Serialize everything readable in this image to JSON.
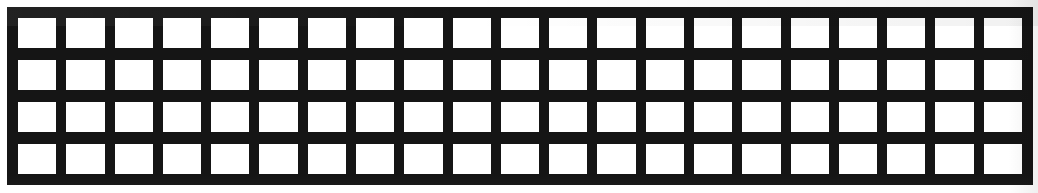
{
  "figure": {
    "kind": "grid-lattice"
  },
  "canvas": {
    "width_px": 1038,
    "height_px": 193,
    "background_color": "#ffffff"
  },
  "lattice": {
    "bar_color": "#151515",
    "cell_color": "#ffffff",
    "columns": 21,
    "rows": 4,
    "vertical_bars": 22,
    "horizontal_bars": 5,
    "panel": {
      "left_px": 7,
      "top_px": 7,
      "width_px": 1026,
      "height_px": 178
    },
    "bar_thickness": {
      "vertical_px": 10,
      "horizontal_px": 12,
      "outer_border_px": 11
    },
    "cell_size": {
      "width_px": 38,
      "height_px": 35
    }
  }
}
